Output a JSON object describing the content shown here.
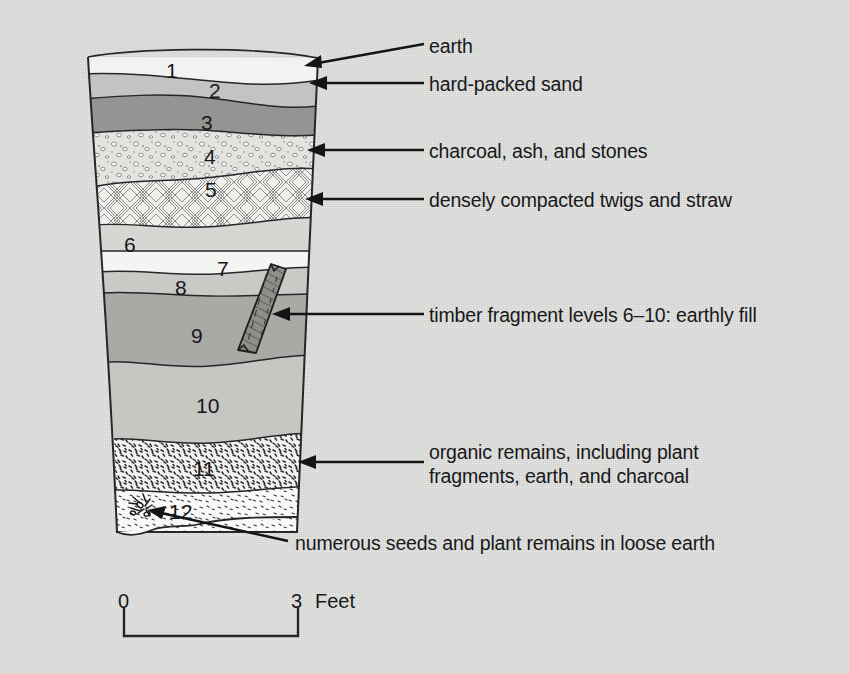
{
  "figure": {
    "background_color": "#dcdcda",
    "ink_color": "#18181a"
  },
  "annotations": [
    {
      "id": "earth",
      "text": "earth",
      "layer_ref": "1",
      "x": 429,
      "y": 44
    },
    {
      "id": "hard-packed-sand",
      "text": "hard-packed sand",
      "layer_ref": "2",
      "x": 429,
      "y": 74
    },
    {
      "id": "charcoal-ash-stones",
      "text": "charcoal, ash, and stones",
      "layer_ref": "4",
      "x": 429,
      "y": 141
    },
    {
      "id": "twigs-straw",
      "text": "densely compacted twigs and straw",
      "layer_ref": "5",
      "x": 429,
      "y": 190
    },
    {
      "id": "timber-fragment",
      "text": "timber fragment levels 6–10: earthly fill",
      "layer_ref": "6-10",
      "x": 429,
      "y": 305
    },
    {
      "id": "organic-remains-1",
      "text": "organic remains, including plant",
      "layer_ref": "11",
      "x": 429,
      "y": 450
    },
    {
      "id": "organic-remains-2",
      "text": "fragments, earth, and charcoal",
      "layer_ref": "11",
      "x": 429,
      "y": 473
    },
    {
      "id": "seeds-plant-remains",
      "text": "numerous seeds and plant remains in loose earth",
      "layer_ref": "12",
      "x": 295,
      "y": 536
    }
  ],
  "layers": [
    {
      "number": "1",
      "label_x": 172,
      "label_y": 60,
      "fill": "#f2f2f0",
      "pattern": "none",
      "description": "earth"
    },
    {
      "number": "2",
      "label_x": 214,
      "label_y": 79,
      "fill": "#c3c3c1",
      "pattern": "none",
      "description": "hard-packed sand"
    },
    {
      "number": "3",
      "label_x": 206,
      "label_y": 112,
      "fill": "#949492",
      "pattern": "none",
      "description": "dark fill"
    },
    {
      "number": "4",
      "label_x": 209,
      "label_y": 146,
      "fill": "#e0e0dd",
      "pattern": "pebbles",
      "description": "charcoal, ash, and stones"
    },
    {
      "number": "5",
      "label_x": 210,
      "label_y": 179,
      "fill": "#ededea",
      "pattern": "weave",
      "description": "densely compacted twigs and straw"
    },
    {
      "number": "6",
      "label_x": 129,
      "label_y": 237,
      "fill": "#d6d6d3",
      "pattern": "none",
      "description": "earthly fill"
    },
    {
      "number": "7",
      "label_x": 222,
      "label_y": 262,
      "fill": "#f4f4f2",
      "pattern": "none",
      "description": "earthly fill"
    },
    {
      "number": "8",
      "label_x": 180,
      "label_y": 281,
      "fill": "#c9c9c6",
      "pattern": "none",
      "description": "earthly fill"
    },
    {
      "number": "9",
      "label_x": 196,
      "label_y": 329,
      "fill": "#a9a9a6",
      "pattern": "none",
      "description": "earthly fill"
    },
    {
      "number": "10",
      "label_x": 205,
      "label_y": 399,
      "fill": "#c6c6c3",
      "pattern": "none",
      "description": "earthly fill"
    },
    {
      "number": "11",
      "label_x": 202,
      "label_y": 462,
      "fill": "#f0f0ee",
      "pattern": "stipple",
      "description": "organic remains, including plant fragments, earth, and charcoal"
    },
    {
      "number": "12",
      "label_x": 178,
      "label_y": 505,
      "fill": "#f7f7f5",
      "pattern": "fine-stipple",
      "description": "numerous seeds and plant remains in loose earth"
    }
  ],
  "scale_bar": {
    "min_label": "0",
    "max_label": "3",
    "unit_label": "Feet",
    "min_x": 124,
    "max_x": 298,
    "y": 621
  }
}
